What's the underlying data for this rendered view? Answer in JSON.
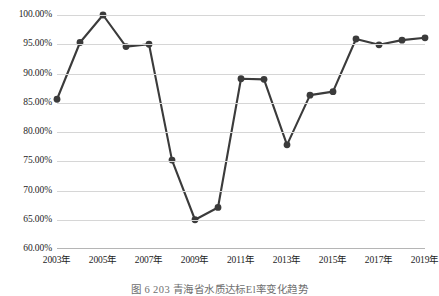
{
  "chart_data": {
    "type": "line",
    "title": "",
    "subtitle": "",
    "xlabel": "",
    "ylabel": "",
    "grid": true,
    "legend": false,
    "legend_position": "none",
    "ylim": [
      60,
      100
    ],
    "ytick_values": [
      100,
      95,
      90,
      85,
      80,
      75,
      70,
      65,
      60
    ],
    "ytick_labels": [
      "100.00%",
      "95.00%",
      "90.00%",
      "85.00%",
      "80.00%",
      "75.00%",
      "70.00%",
      "65.00%",
      "60.00%"
    ],
    "x": [
      2003,
      2004,
      2005,
      2006,
      2007,
      2008,
      2009,
      2010,
      2011,
      2012,
      2013,
      2014,
      2015,
      2016,
      2017,
      2018,
      2019
    ],
    "xtick_values": [
      2003,
      2005,
      2007,
      2009,
      2011,
      2013,
      2015,
      2017,
      2019
    ],
    "xtick_labels": [
      "2003年",
      "2005年",
      "2007年",
      "2009年",
      "2011年",
      "2013年",
      "2015年",
      "2017年",
      "2019年"
    ],
    "series": [
      {
        "name": "比率",
        "values": [
          85.6,
          95.3,
          100.0,
          94.6,
          95.0,
          75.2,
          65.0,
          67.1,
          89.1,
          89.0,
          77.8,
          86.3,
          86.9,
          95.9,
          94.9,
          95.7,
          96.1
        ],
        "color": "#3b3b3b",
        "marker": "circle",
        "line_width": 2.1,
        "marker_size": 3.4
      }
    ],
    "grid_color": "#d6d6d6",
    "axis_color": "#b5b5b5",
    "text_color": "#1d1d1d",
    "background": "#ffffff"
  },
  "caption": {
    "text": "图 6  203   青海省水质达标El率变化趋势"
  }
}
